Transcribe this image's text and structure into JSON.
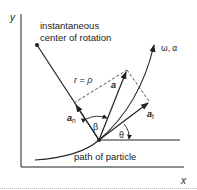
{
  "diagram": {
    "axes": {
      "x_label": "x",
      "y_label": "y"
    },
    "labels": {
      "center_line1": "instantaneous",
      "center_line2": "center of rotation",
      "radius": "r = ρ",
      "accel": "a",
      "accel_normal": "a",
      "accel_normal_sub": "n",
      "accel_tangent": "a",
      "accel_tangent_sub": "t",
      "beta": "β",
      "theta": "θ",
      "omega_alpha": "ω, α",
      "path": "path of particle"
    },
    "colors": {
      "ink": "#222222",
      "background": "#ffffff",
      "dotted": "#bbbbbb"
    }
  }
}
